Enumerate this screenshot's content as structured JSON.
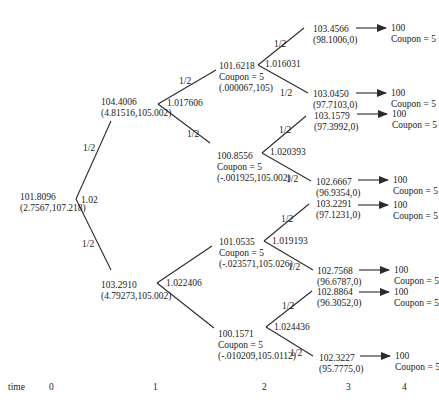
{
  "diagram": {
    "type": "binomial-interest-rate-tree",
    "root": {
      "value": "101.8096",
      "pair": "(2.7567,107.218)",
      "rate": "1.02",
      "prob_up": "1/2",
      "prob_down": "1/2"
    },
    "nodes": [
      {
        "id": "t1_up",
        "lines": [
          "104.4006",
          "(4.81516,105.002)"
        ],
        "x": 101,
        "y": 97,
        "rate": "1.017606",
        "rate_x": 167,
        "rate_y": 98
      },
      {
        "id": "t1_down",
        "lines": [
          "103.2910",
          "(4.79273,105.002)"
        ],
        "x": 101,
        "y": 280,
        "rate": "1.022406",
        "rate_x": 166,
        "rate_y": 278
      },
      {
        "id": "t2_uu",
        "lines": [
          "101.6218",
          "Coupon = 5",
          "(.000067,105)"
        ],
        "x": 219,
        "y": 61,
        "rate": "1.016031",
        "rate_x": 265,
        "rate_y": 59
      },
      {
        "id": "t2_ud",
        "lines": [
          "100.8556",
          "Coupon = 5",
          "(-.001925,105.002)"
        ],
        "x": 217,
        "y": 151,
        "rate": "1.020393",
        "rate_x": 270,
        "rate_y": 147
      },
      {
        "id": "t2_du",
        "lines": [
          "101.0535",
          "Coupon = 5",
          "(-.023571,105.026)"
        ],
        "x": 219,
        "y": 237,
        "rate": "1.019193",
        "rate_x": 272,
        "rate_y": 236
      },
      {
        "id": "t2_dd",
        "lines": [
          "100.1571",
          "Coupon = 5",
          "(-.010209,105.0112)"
        ],
        "x": 218,
        "y": 329,
        "rate": "1.024436",
        "rate_x": 274,
        "rate_y": 322
      }
    ],
    "leaves": [
      {
        "lines": [
          "103.4566",
          "(98.1006,0)"
        ],
        "x": 313,
        "y": 24,
        "payoff": [
          "100",
          "Coupon = 5"
        ]
      },
      {
        "lines": [
          "103.0450",
          "(97.7103,0)"
        ],
        "x": 313,
        "y": 89,
        "payoff": [
          "100",
          "Coupon = 5"
        ]
      },
      {
        "lines": [
          "103.1579",
          "(97.3992,0)"
        ],
        "x": 314,
        "y": 111,
        "payoff": [
          "100",
          "Coupon = 5"
        ]
      },
      {
        "lines": [
          "102.6667",
          "(96.9354,0)"
        ],
        "x": 316,
        "y": 177,
        "payoff": [
          "100",
          "Coupon = 5"
        ]
      },
      {
        "lines": [
          "103.2291",
          "(97.1231,0)"
        ],
        "x": 316,
        "y": 199,
        "payoff": [
          "100",
          "Coupon = 5"
        ]
      },
      {
        "lines": [
          "102.7568",
          "(96.6787,0)"
        ],
        "x": 317,
        "y": 266,
        "payoff": [
          "100",
          "Coupon = 5"
        ]
      },
      {
        "lines": [
          "102.8864",
          "(96.3052,0)"
        ],
        "x": 317,
        "y": 287,
        "payoff": [
          "100",
          "Coupon = 5"
        ]
      },
      {
        "lines": [
          "102.3227",
          "(95.7775,0)"
        ],
        "x": 319,
        "y": 353,
        "payoff": [
          "100",
          "Coupon = 5"
        ]
      }
    ],
    "probability_labels": [
      {
        "text": "1/2",
        "x": 83,
        "y": 143
      },
      {
        "text": "1/2",
        "x": 82,
        "y": 239
      },
      {
        "text": "1/2",
        "x": 179,
        "y": 76
      },
      {
        "text": "1/2",
        "x": 187,
        "y": 129
      },
      {
        "text": "1/2",
        "x": 274,
        "y": 39
      },
      {
        "text": "1/2",
        "x": 280,
        "y": 88
      },
      {
        "text": "1/2",
        "x": 279,
        "y": 125
      },
      {
        "text": "1/2",
        "x": 286,
        "y": 174
      },
      {
        "text": "1/2",
        "x": 281,
        "y": 214
      },
      {
        "text": "1/2",
        "x": 288,
        "y": 262
      },
      {
        "text": "1/2",
        "x": 282,
        "y": 301
      },
      {
        "text": "1/2",
        "x": 290,
        "y": 348
      }
    ],
    "time_axis": {
      "label": "time",
      "ticks": [
        {
          "text": "0",
          "x": 49
        },
        {
          "text": "1",
          "x": 153
        },
        {
          "text": "2",
          "x": 262
        },
        {
          "text": "3",
          "x": 346
        },
        {
          "text": "4",
          "x": 402
        }
      ],
      "y": 382
    },
    "edges": [
      [
        76,
        199,
        111,
        121
      ],
      [
        76,
        199,
        111,
        270
      ],
      [
        158,
        104,
        216,
        70
      ],
      [
        158,
        104,
        210,
        143
      ],
      [
        157,
        283,
        212,
        246
      ],
      [
        157,
        283,
        214,
        328
      ],
      [
        258,
        65,
        304,
        28
      ],
      [
        258,
        65,
        308,
        93
      ],
      [
        262,
        153,
        306,
        116
      ],
      [
        262,
        153,
        311,
        181
      ],
      [
        264,
        241,
        309,
        204
      ],
      [
        264,
        241,
        313,
        270
      ],
      [
        266,
        327,
        312,
        291
      ],
      [
        266,
        327,
        313,
        356
      ]
    ],
    "arrows": [
      [
        356,
        28,
        386,
        28
      ],
      [
        356,
        93,
        386,
        93
      ],
      [
        357,
        114,
        387,
        114
      ],
      [
        358,
        180,
        388,
        180
      ],
      [
        358,
        205,
        388,
        205
      ],
      [
        359,
        270,
        389,
        270
      ],
      [
        359,
        292,
        389,
        292
      ],
      [
        360,
        356,
        390,
        356
      ]
    ],
    "colors": {
      "line": "#2b2b2b",
      "text": "#1a1a1a",
      "background": "#ffffff"
    }
  }
}
